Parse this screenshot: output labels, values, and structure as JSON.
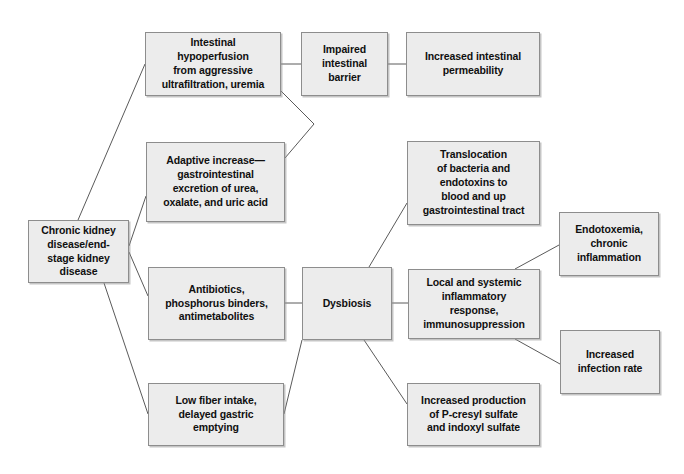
{
  "diagram": {
    "style": {
      "node_fill": "#ececec",
      "node_border": "#8d8d8d",
      "edge_color": "#5a5a5a",
      "text_color": "#101010",
      "background": "#ffffff"
    },
    "nodes": [
      {
        "id": "ckd",
        "label": "Chronic kidney\ndisease/end-\nstage kidney\ndisease",
        "x": 28,
        "y": 220,
        "w": 101,
        "h": 63
      },
      {
        "id": "hypoperfusion",
        "label": "Intestinal\nhypoperfusion\nfrom aggressive\nultrafiltration, uremia",
        "x": 145,
        "y": 32,
        "w": 136,
        "h": 64
      },
      {
        "id": "impaired-barrier",
        "label": "Impaired\nintestinal\nbarrier",
        "x": 301,
        "y": 32,
        "w": 87,
        "h": 64
      },
      {
        "id": "permeability",
        "label": "Increased intestinal\npermeability",
        "x": 406,
        "y": 32,
        "w": 134,
        "h": 64
      },
      {
        "id": "adaptive-increase",
        "label": "Adaptive increase—\ngastrointestinal\nexcretion of urea,\noxalate, and uric acid",
        "x": 146,
        "y": 142,
        "w": 139,
        "h": 80
      },
      {
        "id": "translocation",
        "label": "Translocation\nof bacteria and\nendotoxins to\nblood and up\ngastrointestinal tract",
        "x": 407,
        "y": 141,
        "w": 133,
        "h": 84
      },
      {
        "id": "endotoxemia",
        "label": "Endotoxemia,\nchronic\ninflammation",
        "x": 559,
        "y": 212,
        "w": 100,
        "h": 64
      },
      {
        "id": "antibiotics",
        "label": "Antibiotics,\nphosphorus binders,\nantimetabolites",
        "x": 148,
        "y": 267,
        "w": 137,
        "h": 73
      },
      {
        "id": "dysbiosis",
        "label": "Dysbiosis",
        "x": 302,
        "y": 267,
        "w": 90,
        "h": 73
      },
      {
        "id": "inflammatory-response",
        "label": "Local and systemic\ninflammatory\nresponse,\nimmunosuppression",
        "x": 408,
        "y": 269,
        "w": 132,
        "h": 70
      },
      {
        "id": "infection-rate",
        "label": "Increased\ninfection rate",
        "x": 560,
        "y": 330,
        "w": 100,
        "h": 64
      },
      {
        "id": "low-fiber",
        "label": "Low fiber intake,\ndelayed gastric\nemptying",
        "x": 148,
        "y": 383,
        "w": 136,
        "h": 63
      },
      {
        "id": "sulfates",
        "label": "Increased production\nof P-cresyl sulfate\nand indoxyl sulfate",
        "x": 407,
        "y": 383,
        "w": 133,
        "h": 63
      }
    ],
    "edges": [
      {
        "from": "ckd",
        "to": "hypoperfusion",
        "points": "78,220 145,64"
      },
      {
        "from": "ckd",
        "to": "adaptive-increase",
        "points": "129,246 146,196"
      },
      {
        "from": "ckd",
        "to": "antibiotics",
        "points": "129,252 148,296"
      },
      {
        "from": "ckd",
        "to": "low-fiber",
        "points": "104,283 148,414"
      },
      {
        "from": "hypoperfusion",
        "to": "impaired-barrier",
        "points": "281,64 301,64"
      },
      {
        "from": "impaired-barrier",
        "to": "permeability",
        "points": "388,64 406,64"
      },
      {
        "from": "hypoperfusion",
        "to": "merge-vertex",
        "points": "281,91 314,124"
      },
      {
        "from": "adaptive-increase",
        "to": "merge-vertex",
        "points": "285,158 314,124"
      },
      {
        "from": "antibiotics",
        "to": "dysbiosis",
        "points": "285,303 302,303"
      },
      {
        "from": "low-fiber",
        "to": "dysbiosis",
        "points": "284,414 302,340"
      },
      {
        "from": "dysbiosis",
        "to": "translocation",
        "points": "369,267 407,203"
      },
      {
        "from": "dysbiosis",
        "to": "inflammatory-response",
        "points": "392,303 408,303"
      },
      {
        "from": "dysbiosis",
        "to": "sulfates",
        "points": "364,340 407,404"
      },
      {
        "from": "inflammatory-response",
        "to": "endotoxemia",
        "points": "515,269 559,245"
      },
      {
        "from": "inflammatory-response",
        "to": "infection-rate",
        "points": "515,339 560,364"
      }
    ]
  }
}
